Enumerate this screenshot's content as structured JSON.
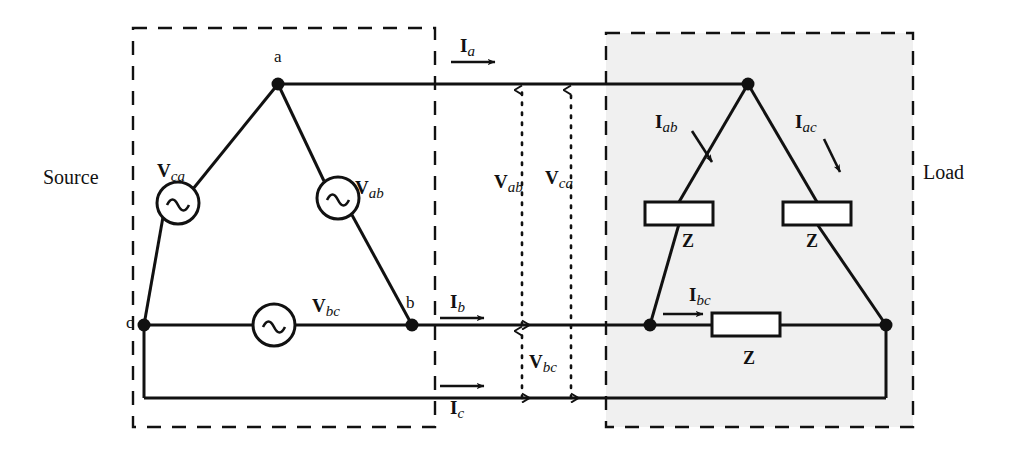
{
  "figure": {
    "title_left": "Source",
    "title_right": "Load",
    "type": "delta-delta three-phase circuit diagram"
  },
  "source": {
    "box_label": "Source",
    "nodes": [
      {
        "name": "a",
        "label": "a"
      },
      {
        "name": "b",
        "label": "b"
      },
      {
        "name": "c",
        "label": "c"
      }
    ],
    "sources": [
      {
        "name": "v-ca",
        "base": "V",
        "sub": "ca",
        "symbol": "ac-source-icon"
      },
      {
        "name": "v-ab",
        "base": "V",
        "sub": "ab",
        "symbol": "ac-source-icon"
      },
      {
        "name": "v-bc",
        "base": "V",
        "sub": "bc",
        "symbol": "ac-source-icon"
      }
    ]
  },
  "lines": {
    "currents": [
      {
        "name": "i-a",
        "base": "I",
        "sub": "a"
      },
      {
        "name": "i-b",
        "base": "I",
        "sub": "b"
      },
      {
        "name": "i-c",
        "base": "I",
        "sub": "c"
      }
    ],
    "voltages": [
      {
        "name": "v-ab",
        "base": "V",
        "sub": "ab"
      },
      {
        "name": "v-ca",
        "base": "V",
        "sub": "ca"
      },
      {
        "name": "v-bc",
        "base": "V",
        "sub": "bc"
      }
    ]
  },
  "load": {
    "box_label": "Load",
    "currents": [
      {
        "name": "i-ab",
        "base": "I",
        "sub": "ab"
      },
      {
        "name": "i-ac",
        "base": "I",
        "sub": "ac"
      },
      {
        "name": "i-bc",
        "base": "I",
        "sub": "bc"
      }
    ],
    "impedances": [
      {
        "name": "z-ab",
        "label": "Z"
      },
      {
        "name": "z-ac",
        "label": "Z"
      },
      {
        "name": "z-bc",
        "label": "Z"
      }
    ]
  },
  "colors": {
    "ink": "#111111",
    "load_fill": "#f0f0f0",
    "background": "#ffffff"
  }
}
